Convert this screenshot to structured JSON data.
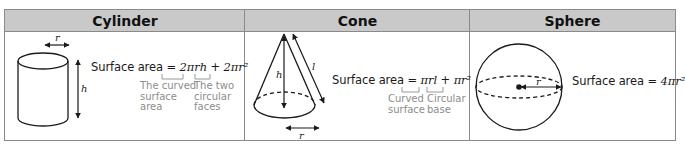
{
  "columns": [
    {
      "header": "Cylinder",
      "formula": {
        "prefix": "Surface area = ",
        "term1": "2πrh",
        "plus": " + ",
        "term2": "2πr²"
      },
      "notes": [
        "The curved\nsurface\narea",
        "The two\ncircular\nfaces"
      ],
      "labels": {
        "radius": "r",
        "height": "h"
      }
    },
    {
      "header": "Cone",
      "formula": {
        "prefix": "Surface area = ",
        "term1": "πrl",
        "plus": " + ",
        "term2": "πr²"
      },
      "notes": [
        "Curved\nsurface",
        "Circular\nbase"
      ],
      "labels": {
        "radius": "r",
        "height": "h",
        "slant": "l"
      }
    },
    {
      "header": "Sphere",
      "formula": {
        "prefix": "Surface area = ",
        "term1": "4πr²"
      },
      "labels": {
        "radius": "r"
      }
    }
  ],
  "colors": {
    "header_bg": "#c9c9c9",
    "border": "#8a8a8a",
    "note_text": "#8c8c8c",
    "line": "#1a1a1a"
  }
}
